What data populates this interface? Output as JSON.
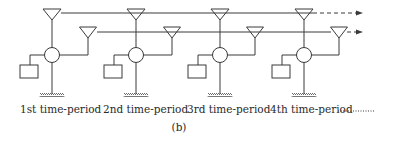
{
  "diagram": {
    "caption": "(b)",
    "colors": {
      "line": "#3a3a3a",
      "text": "#2a2a2a",
      "background": "#ffffff"
    },
    "continuation": "dashed arrows to the right on both transmission lines; dotted line after last label",
    "periods": [
      {
        "label": "1st time-period",
        "x": 52,
        "x2": 88,
        "label_x": 20,
        "square_x": 20
      },
      {
        "label": "2nd time-period",
        "x": 136,
        "x2": 172,
        "label_x": 103,
        "square_x": 104
      },
      {
        "label": "3rd time-period",
        "x": 220,
        "x2": 255,
        "label_x": 187,
        "square_x": 188
      },
      {
        "label": "4th time-period",
        "x": 304,
        "x2": 339,
        "label_x": 270,
        "square_x": 272
      }
    ],
    "components": {
      "top_antenna": "triangle",
      "lower_antenna": "triangle",
      "node": "circle",
      "storage": "square",
      "ground": "hatched ground"
    }
  }
}
